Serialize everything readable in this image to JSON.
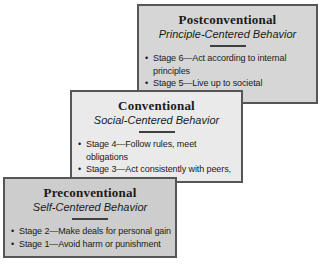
{
  "diagram": {
    "bullet_char": "•",
    "border_color": "#565656",
    "text_color": "#1a1a1a",
    "boxes": [
      {
        "id": "postconventional",
        "title": "Postconventional",
        "subtitle": "Principle-Centered Behavior",
        "fill": "#d6d6d6",
        "bullets": [
          "Stage 6—Act according to internal principles",
          "Stage 5—Live up to societal expectations"
        ]
      },
      {
        "id": "conventional",
        "title": "Conventional",
        "subtitle": "Social-Centered Behavior",
        "fill": "#eaeaea",
        "bullets": [
          "Stage 4—Follow rules, meet obligations",
          "Stage 3—Act consistently with peers, others"
        ]
      },
      {
        "id": "preconventional",
        "title": "Preconventional",
        "subtitle": "Self-Centered Behavior",
        "fill": "#cdcdcd",
        "bullets": [
          "Stage 2—Make deals for personal gain",
          "Stage 1—Avoid harm or punishment"
        ]
      }
    ]
  }
}
